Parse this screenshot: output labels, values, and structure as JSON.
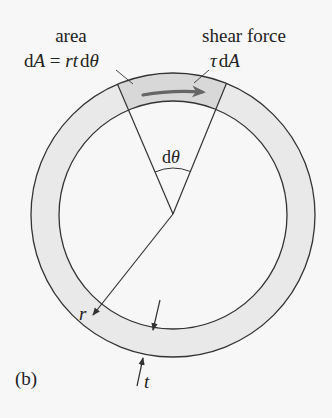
{
  "figure": {
    "panel_label": "(b)",
    "colors": {
      "background": "#f7f7f7",
      "ring_fill": "#e9e9e9",
      "element_fill": "#dcdcdc",
      "line": "#333333",
      "shear_arrow": "#666666"
    },
    "ring": {
      "center": [
        173,
        215
      ],
      "outer_radius": 142,
      "inner_radius": 114
    },
    "labels": {
      "area_title": "area",
      "area_eq_d": "d",
      "area_eq_A": "A",
      "area_eq_mid": " = ",
      "area_eq_rt": "rt",
      "area_eq_d2": "d",
      "area_eq_theta": "θ",
      "shear_title": "shear force",
      "shear_tau": "τ",
      "shear_d": "d",
      "shear_A": "A",
      "angle_d": "d",
      "angle_theta": "θ",
      "radius": "r",
      "thickness": "t"
    }
  }
}
